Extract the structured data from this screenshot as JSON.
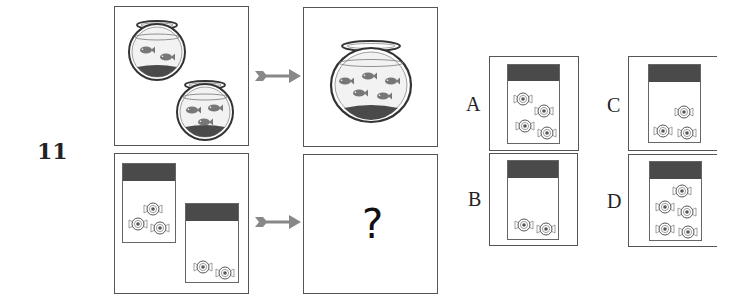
{
  "question": {
    "number": "11",
    "unknown_symbol": "?"
  },
  "example_row": {
    "left_panel": {
      "description": "two fishbowls",
      "bowls": [
        {
          "fish_count": 2
        },
        {
          "fish_count": 3
        }
      ]
    },
    "arrow": "right-arrow",
    "right_panel": {
      "description": "one large fishbowl",
      "fish_count": 5
    }
  },
  "question_row": {
    "left_panel": {
      "description": "two candy jars",
      "jars": [
        {
          "candy_count": 3
        },
        {
          "candy_count": 2
        }
      ]
    },
    "arrow": "right-arrow",
    "right_panel": {
      "content": "?"
    }
  },
  "options": [
    {
      "label": "A",
      "candy_count": 4
    },
    {
      "label": "B",
      "candy_count": 2
    },
    {
      "label": "C",
      "candy_count": 3
    },
    {
      "label": "D",
      "candy_count": 5
    }
  ],
  "colors": {
    "border": "#555555",
    "lid": "#4a4a4a",
    "fish": "#777777",
    "gravel": "#3a3a3a",
    "arrow": "#888888"
  }
}
